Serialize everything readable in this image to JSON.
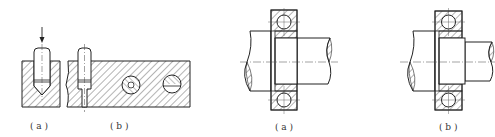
{
  "figure_left": {
    "sub_a": {
      "label": "( a )"
    },
    "sub_b": {
      "label": "( b )"
    }
  },
  "figure_right": {
    "sub_a": {
      "label": "( a )"
    },
    "sub_b": {
      "label": "( b )"
    }
  },
  "colors": {
    "line": "#222222",
    "hatch": "#444444",
    "background": "#ffffff"
  }
}
